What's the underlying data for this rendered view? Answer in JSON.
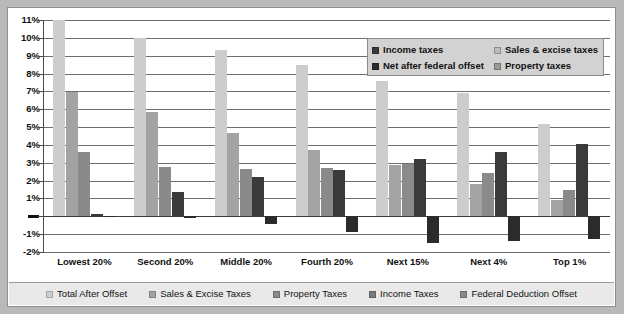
{
  "chart_data": {
    "type": "bar",
    "title": "",
    "xlabel": "",
    "ylabel": "",
    "ylim": [
      -2,
      11
    ],
    "ytick_labels": [
      "11%",
      "10%",
      "9%",
      "8%",
      "7%",
      "6%",
      "5%",
      "4%",
      "3%",
      "2%",
      "1%",
      "—",
      "-1%",
      "-2%"
    ],
    "ytick_values": [
      11,
      10,
      9,
      8,
      7,
      6,
      5,
      4,
      3,
      2,
      1,
      0,
      -1,
      -2
    ],
    "grid": true,
    "legend_position": "inside-top-right and below-axis",
    "categories": [
      "Lowest 20%",
      "Second 20%",
      "Middle 20%",
      "Fourth 20%",
      "Next 15%",
      "Next 4%",
      "Top 1%"
    ],
    "series": [
      {
        "name": "Total After Offset",
        "color": "#cdcdcd",
        "values": [
          11.4,
          10.0,
          9.3,
          8.5,
          7.6,
          6.9,
          5.2
        ]
      },
      {
        "name": "Sales & Excise Taxes",
        "color": "#a3a3a3",
        "values": [
          6.95,
          5.85,
          4.65,
          3.7,
          2.85,
          1.8,
          0.9
        ]
      },
      {
        "name": "Property Taxes",
        "color": "#8a8a8a",
        "values": [
          3.6,
          2.75,
          2.65,
          2.7,
          2.95,
          2.4,
          1.5
        ]
      },
      {
        "name": "Income Taxes",
        "color": "#3a3a3a",
        "values": [
          0.15,
          1.35,
          2.2,
          2.6,
          3.2,
          3.6,
          4.05
        ]
      },
      {
        "name": "Federal Deduction Offset",
        "color": "#2b2b2b",
        "values": [
          -0.05,
          -0.1,
          -0.45,
          -0.9,
          -1.5,
          -1.4,
          -1.3
        ]
      }
    ]
  },
  "inner_legend": {
    "entries": [
      {
        "label": "Income taxes",
        "color": "#3a3a3a"
      },
      {
        "label": "Sales & excise taxes",
        "color": "#bdbdbd"
      },
      {
        "label": "Net after federal offset",
        "color": "#2b2b2b"
      },
      {
        "label": "Property taxes",
        "color": "#9a9a9a"
      }
    ]
  },
  "bottom_legend": {
    "entries": [
      {
        "label": "Total After Offset",
        "color": "#cdcdcd"
      },
      {
        "label": "Sales & Excise Taxes",
        "color": "#a3a3a3"
      },
      {
        "label": "Property Taxes",
        "color": "#8a8a8a"
      },
      {
        "label": "Income Taxes",
        "color": "#7a7a7a"
      },
      {
        "label": "Federal Deduction Offset",
        "color": "#8a8a8a"
      }
    ]
  }
}
